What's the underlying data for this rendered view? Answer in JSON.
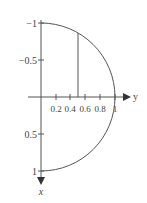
{
  "figure": {
    "type": "semicircle-region-diagram",
    "vertical_axis": {
      "label": "x",
      "direction": "down",
      "tick_labels": [
        "−1",
        "−0.5",
        "0.5",
        "1"
      ],
      "tick_values": [
        -1,
        -0.5,
        0.5,
        1
      ]
    },
    "horizontal_axis": {
      "label": "y",
      "direction": "right",
      "tick_labels": [
        "0.2",
        "0.4",
        "0.6",
        "0.8",
        "1"
      ],
      "tick_values": [
        0.2,
        0.4,
        0.6,
        0.8,
        1
      ]
    },
    "curve": "y = sqrt(1 - x^2), x from -1 to 1",
    "strip_line": {
      "y": 0.5,
      "from_x": 0,
      "to_x": -0.866
    },
    "colors": {
      "stroke": "#555555",
      "text": "#444444"
    }
  },
  "labels": {
    "x_axis": "x",
    "y_axis": "y",
    "t_neg1": "−1",
    "t_neg05": "−0.5",
    "t_05": "0.5",
    "t_1": "1",
    "h_02": "0.2",
    "h_04": "0.4",
    "h_06": "0.6",
    "h_08": "0.8",
    "h_1": "1"
  }
}
